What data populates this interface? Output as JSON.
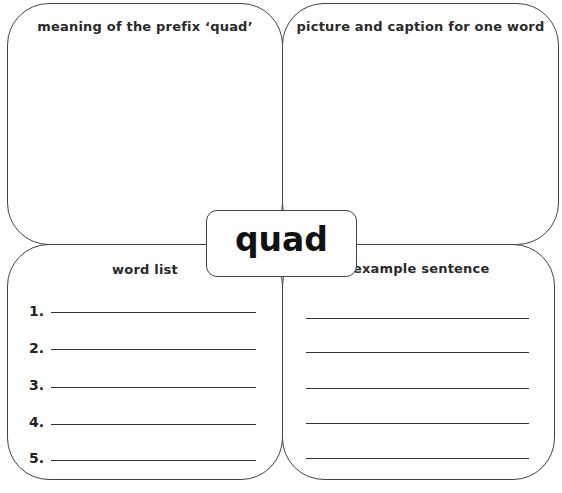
{
  "center": {
    "word": "quad"
  },
  "panels": {
    "top_left": {
      "title": "meaning of the prefix ‘quad’"
    },
    "top_right": {
      "title": "picture and caption for one word"
    },
    "bottom_left": {
      "title": "word list",
      "items": [
        {
          "number": "1.",
          "value": ""
        },
        {
          "number": "2.",
          "value": ""
        },
        {
          "number": "3.",
          "value": ""
        },
        {
          "number": "4.",
          "value": ""
        },
        {
          "number": "5.",
          "value": ""
        }
      ]
    },
    "bottom_right": {
      "title": "example sentence",
      "line_count": 5
    }
  },
  "colors": {
    "border": "#444444",
    "text": "#222222",
    "background": "#ffffff"
  }
}
